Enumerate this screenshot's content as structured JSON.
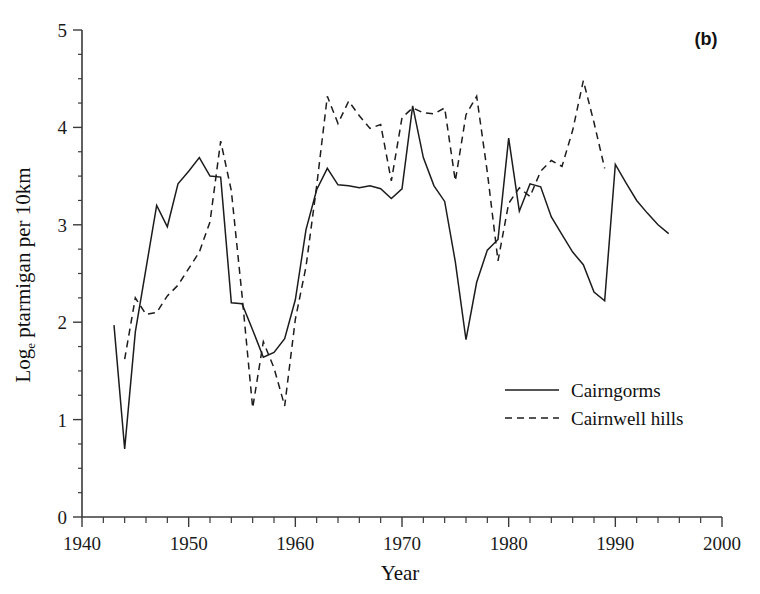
{
  "figure": {
    "panel_label": "(b)",
    "background_color": "#ffffff",
    "ink_color": "#1c1c1c"
  },
  "chart_data": {
    "type": "line",
    "title": "",
    "subtitle": "",
    "panel": "(b)",
    "xlabel": "Year",
    "ylabel": "Log_e ptarmigan per 10km",
    "ylabel_parts": {
      "prefix": "Log",
      "subscript": "e",
      "suffix": " ptarmigan per 10km"
    },
    "xlim": [
      1940,
      2000
    ],
    "ylim": [
      0,
      5
    ],
    "xticks": [
      1940,
      1950,
      1960,
      1970,
      1980,
      1990,
      2000
    ],
    "xtick_labels": [
      "1940",
      "1950",
      "1960",
      "1970",
      "1980",
      "1990",
      "2000"
    ],
    "xminor_tick_step": 2,
    "yticks": [
      0,
      1,
      2,
      3,
      4,
      5
    ],
    "ytick_labels": [
      "0",
      "1",
      "2",
      "3",
      "4",
      "5"
    ],
    "yminor_tick_step": 0.25,
    "grid": false,
    "legend_position": "center-right",
    "series": [
      {
        "name": "Cairngorms",
        "style": "solid",
        "color": "#1c1c1c",
        "x": [
          1943,
          1944,
          1945,
          1946,
          1947,
          1948,
          1949,
          1950,
          1951,
          1952,
          1953,
          1954,
          1955,
          1956,
          1957,
          1958,
          1959,
          1960,
          1961,
          1962,
          1963,
          1964,
          1965,
          1966,
          1967,
          1968,
          1969,
          1970,
          1971,
          1972,
          1973,
          1974,
          1975,
          1976,
          1977,
          1978,
          1979,
          1980,
          1981,
          1982,
          1983,
          1984,
          1985,
          1986,
          1987,
          1988,
          1989,
          1990,
          1991,
          1992,
          1993,
          1994,
          1995
        ],
        "y": [
          1.97,
          0.7,
          1.9,
          2.55,
          3.2,
          2.98,
          3.42,
          3.55,
          3.69,
          3.5,
          3.49,
          2.2,
          2.19,
          1.92,
          1.64,
          1.69,
          1.83,
          2.23,
          2.95,
          3.36,
          3.58,
          3.41,
          3.4,
          3.38,
          3.4,
          3.37,
          3.27,
          3.37,
          4.22,
          3.69,
          3.4,
          3.24,
          2.62,
          1.82,
          2.41,
          2.74,
          2.85,
          3.89,
          3.14,
          3.42,
          3.39,
          3.08,
          2.9,
          2.72,
          2.59,
          2.31,
          2.22,
          3.62,
          3.43,
          3.25,
          3.12,
          3.0,
          2.91
        ]
      },
      {
        "name": "Cairnwell hills",
        "style": "dashed",
        "color": "#1c1c1c",
        "x": [
          1944,
          1945,
          1946,
          1947,
          1948,
          1949,
          1950,
          1951,
          1952,
          1953,
          1954,
          1955,
          1956,
          1957,
          1958,
          1959,
          1960,
          1961,
          1962,
          1963,
          1964,
          1965,
          1966,
          1967,
          1968,
          1969,
          1970,
          1971,
          1972,
          1973,
          1974,
          1975,
          1976,
          1977,
          1978,
          1979,
          1980,
          1981,
          1982,
          1983,
          1984,
          1985,
          1986,
          1987,
          1988,
          1989
        ],
        "y": [
          1.62,
          2.25,
          2.08,
          2.1,
          2.27,
          2.38,
          2.55,
          2.72,
          3.03,
          3.86,
          3.35,
          2.28,
          1.12,
          1.8,
          1.53,
          1.14,
          2.03,
          2.57,
          3.4,
          4.32,
          4.04,
          4.27,
          4.12,
          3.99,
          4.03,
          3.45,
          4.1,
          4.2,
          4.15,
          4.14,
          4.2,
          3.45,
          4.13,
          4.32,
          3.54,
          2.63,
          3.22,
          3.38,
          3.29,
          3.55,
          3.66,
          3.6,
          3.97,
          4.48,
          4.05,
          3.58
        ]
      }
    ]
  },
  "legend": {
    "items": [
      {
        "label": "Cairngorms",
        "style": "solid"
      },
      {
        "label": "Cairnwell hills",
        "style": "dashed"
      }
    ]
  }
}
